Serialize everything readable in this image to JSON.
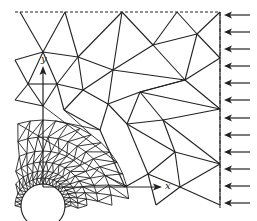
{
  "figure": {
    "type": "finite-element mesh",
    "axes": {
      "x_label": "x",
      "y_label": "y",
      "origin": [
        43,
        187
      ],
      "x_tip": [
        162,
        187
      ],
      "y_tip": [
        43,
        66
      ]
    },
    "hole": {
      "cx": 43,
      "cy": 206,
      "r": 22
    },
    "boundary": {
      "top": {
        "x1": 15,
        "x2": 220,
        "y": 12,
        "style": "dashed"
      },
      "right": {
        "x": 220,
        "y1": 12,
        "y2": 208,
        "style": "dash-dot"
      }
    },
    "load_arrows": {
      "direction": "left",
      "x_start": 250,
      "x_end": 224,
      "y_positions": [
        15,
        32,
        49,
        66,
        83,
        100,
        118,
        135,
        152,
        169,
        186,
        203
      ]
    },
    "nodes": [
      [
        20,
        12
      ],
      [
        65,
        12
      ],
      [
        122,
        12
      ],
      [
        177,
        12
      ],
      [
        220,
        12
      ],
      [
        43,
        52
      ],
      [
        78,
        57
      ],
      [
        113,
        70
      ],
      [
        153,
        45
      ],
      [
        197,
        34
      ],
      [
        220,
        58
      ],
      [
        185,
        80
      ],
      [
        28,
        84
      ],
      [
        57,
        84
      ],
      [
        83,
        90
      ],
      [
        140,
        92
      ],
      [
        108,
        104
      ],
      [
        43,
        106
      ],
      [
        64,
        110
      ],
      [
        220,
        109
      ],
      [
        163,
        120
      ],
      [
        127,
        124
      ],
      [
        100,
        130
      ],
      [
        175,
        152
      ],
      [
        220,
        164
      ],
      [
        148,
        174
      ],
      [
        180,
        187
      ],
      [
        125,
        187
      ],
      [
        156,
        205
      ],
      [
        15,
        60
      ],
      [
        15,
        100
      ],
      [
        220,
        205
      ]
    ],
    "edges": [
      [
        0,
        5
      ],
      [
        1,
        5
      ],
      [
        1,
        6
      ],
      [
        2,
        6
      ],
      [
        2,
        7
      ],
      [
        2,
        8
      ],
      [
        3,
        8
      ],
      [
        3,
        9
      ],
      [
        4,
        9
      ],
      [
        4,
        10
      ],
      [
        5,
        6
      ],
      [
        6,
        7
      ],
      [
        7,
        8
      ],
      [
        8,
        9
      ],
      [
        9,
        10
      ],
      [
        10,
        11
      ],
      [
        8,
        11
      ],
      [
        7,
        11
      ],
      [
        9,
        11
      ],
      [
        5,
        12
      ],
      [
        5,
        13
      ],
      [
        6,
        13
      ],
      [
        6,
        14
      ],
      [
        7,
        14
      ],
      [
        7,
        16
      ],
      [
        11,
        15
      ],
      [
        11,
        19
      ],
      [
        10,
        19
      ],
      [
        12,
        13
      ],
      [
        13,
        14
      ],
      [
        14,
        16
      ],
      [
        16,
        15
      ],
      [
        15,
        11
      ],
      [
        15,
        19
      ],
      [
        15,
        20
      ],
      [
        19,
        20
      ],
      [
        12,
        17
      ],
      [
        13,
        17
      ],
      [
        13,
        18
      ],
      [
        14,
        18
      ],
      [
        18,
        22
      ],
      [
        16,
        22
      ],
      [
        16,
        21
      ],
      [
        15,
        21
      ],
      [
        21,
        20
      ],
      [
        20,
        24
      ],
      [
        19,
        24
      ],
      [
        20,
        23
      ],
      [
        23,
        24
      ],
      [
        21,
        23
      ],
      [
        21,
        25
      ],
      [
        23,
        25
      ],
      [
        25,
        26
      ],
      [
        23,
        26
      ],
      [
        26,
        24
      ],
      [
        25,
        27
      ],
      [
        22,
        27
      ],
      [
        26,
        28
      ],
      [
        25,
        28
      ],
      [
        24,
        31
      ],
      [
        26,
        31
      ],
      [
        29,
        5
      ],
      [
        29,
        12
      ],
      [
        30,
        12
      ],
      [
        30,
        17
      ]
    ],
    "labels": {
      "x": "x",
      "y": "y"
    }
  }
}
